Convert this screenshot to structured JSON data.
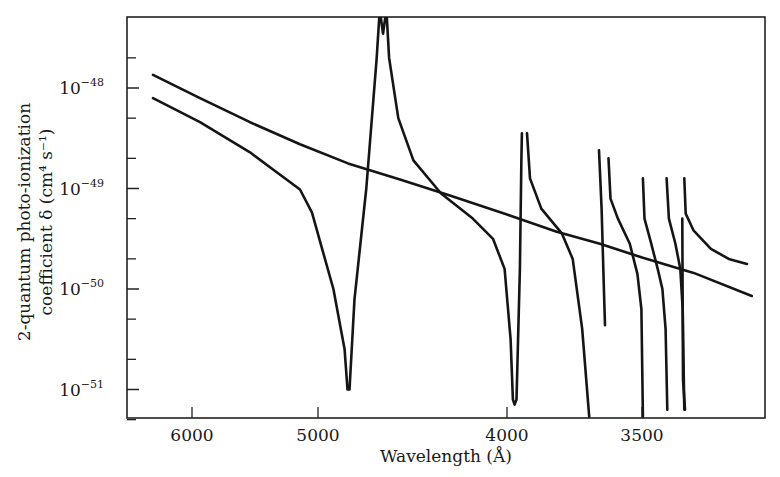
{
  "chart_data": {
    "type": "line",
    "title": "",
    "xlabel": "Wavelength (Å)",
    "ylabel_line1": "2-quantum photo-ionization",
    "ylabel_line2": "coefficient δ (cm⁴ s⁻¹)",
    "x_scale": "inverse (linear in 1/λ), decreasing wavelength to the right",
    "y_scale": "log",
    "xlim": [
      6690,
      3143
    ],
    "ylim_log10": [
      -48.7,
      -51.7
    ],
    "x_ticks": [
      {
        "value": 6000,
        "label": "6000"
      },
      {
        "value": 5000,
        "label": "5000"
      },
      {
        "value": 4000,
        "label": "4000"
      },
      {
        "value": 3500,
        "label": "3500"
      }
    ],
    "y_ticks": [
      {
        "log10": -48,
        "base": "10",
        "exp": "−48"
      },
      {
        "log10": -49,
        "base": "10",
        "exp": "−49"
      },
      {
        "log10": -50,
        "base": "10",
        "exp": "−50"
      },
      {
        "log10": -51,
        "base": "10",
        "exp": "−51"
      }
    ],
    "y_minor_ticks_log10": [
      -47.7,
      -48.3,
      -48.7,
      -49.3,
      -49.7,
      -50.3,
      -50.7,
      -51.3
    ],
    "grid": false,
    "legend": null,
    "series": [
      {
        "name": "smooth (non-resonant) curve",
        "points_lambda_log10delta": [
          [
            6396,
            -47.87
          ],
          [
            5925,
            -48.1
          ],
          [
            5494,
            -48.34
          ],
          [
            5122,
            -48.56
          ],
          [
            4809,
            -48.75
          ],
          [
            4511,
            -48.91
          ],
          [
            4257,
            -49.07
          ],
          [
            4000,
            -49.26
          ],
          [
            3800,
            -49.43
          ],
          [
            3642,
            -49.55
          ],
          [
            3497,
            -49.69
          ],
          [
            3340,
            -49.84
          ],
          [
            3177,
            -50.07
          ]
        ]
      },
      {
        "name": "resonant curve",
        "segments": [
          [
            [
              6396,
              -48.1
            ],
            [
              5925,
              -48.34
            ],
            [
              5494,
              -48.64
            ],
            [
              5122,
              -49.01
            ],
            [
              5040,
              -49.24
            ],
            [
              4980,
              -49.56
            ],
            [
              4900,
              -50.0
            ],
            [
              4830,
              -50.6
            ],
            [
              4812,
              -51.0
            ],
            [
              4800,
              -51.0
            ],
            [
              4770,
              -50.1
            ],
            [
              4700,
              -49.0
            ],
            [
              4640,
              -47.7
            ],
            [
              4625,
              -47.29
            ],
            [
              4617,
              -47.29
            ],
            [
              4604,
              -47.46
            ],
            [
              4591,
              -47.29
            ],
            [
              4583,
              -47.29
            ],
            [
              4570,
              -47.7
            ],
            [
              4520,
              -48.3
            ],
            [
              4440,
              -48.72
            ],
            [
              4300,
              -49.05
            ],
            [
              4150,
              -49.3
            ],
            [
              4060,
              -49.5
            ],
            [
              4010,
              -49.8
            ],
            [
              3985,
              -50.5
            ],
            [
              3975,
              -51.1
            ],
            [
              3968,
              -51.15
            ],
            [
              3960,
              -51.1
            ],
            [
              3946,
              -49.8
            ],
            [
              3940,
              -48.7
            ],
            [
              3938,
              -48.45
            ]
          ],
          [
            [
              3917,
              -48.45
            ],
            [
              3905,
              -48.9
            ],
            [
              3860,
              -49.2
            ],
            [
              3780,
              -49.45
            ],
            [
              3740,
              -49.7
            ],
            [
              3705,
              -50.4
            ],
            [
              3680,
              -51.27
            ]
          ],
          [
            [
              3645,
              -48.62
            ],
            [
              3636,
              -49.2
            ],
            [
              3628,
              -50.0
            ],
            [
              3624,
              -50.36
            ]
          ],
          [
            [
              3612,
              -48.7
            ],
            [
              3605,
              -49.1
            ],
            [
              3580,
              -49.3
            ],
            [
              3540,
              -49.55
            ],
            [
              3515,
              -49.85
            ],
            [
              3502,
              -50.2
            ],
            [
              3497,
              -51.27
            ]
          ],
          [
            [
              3497,
              -48.9
            ],
            [
              3492,
              -49.3
            ],
            [
              3470,
              -49.55
            ],
            [
              3450,
              -49.8
            ],
            [
              3435,
              -50.0
            ],
            [
              3425,
              -50.4
            ],
            [
              3420,
              -51.2
            ]
          ],
          [
            [
              3422,
              -48.9
            ],
            [
              3415,
              -49.3
            ],
            [
              3395,
              -49.55
            ],
            [
              3380,
              -49.8
            ],
            [
              3373,
              -50.2
            ],
            [
              3368,
              -51.2
            ]
          ],
          [
            [
              3368,
              -48.9
            ],
            [
              3364,
              -49.25
            ],
            [
              3340,
              -49.42
            ],
            [
              3290,
              -49.6
            ],
            [
              3240,
              -49.7
            ],
            [
              3190,
              -49.75
            ]
          ],
          [
            [
              3374,
              -49.3
            ],
            [
              3372,
              -50.9
            ],
            [
              3366,
              -51.2
            ]
          ]
        ]
      }
    ]
  }
}
